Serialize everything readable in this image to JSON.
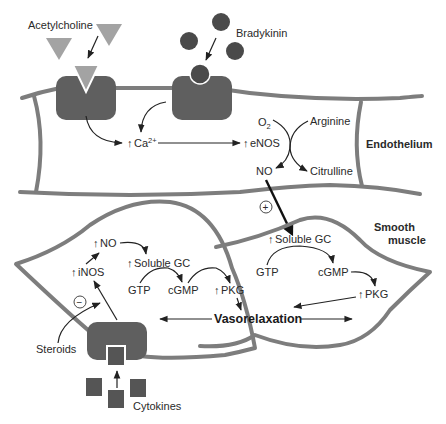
{
  "diagram": {
    "colors": {
      "membrane": "#7d7d7d",
      "receptor": "#5f5f5f",
      "acetylcholine": "#a3a3a3",
      "bradykinin": "#4a4a4a",
      "cytokine": "#555555",
      "text": "#2a2a2a"
    },
    "ligands": {
      "acetylcholine": "Acetylcholine",
      "bradykinin": "Bradykinin",
      "cytokines": "Cytokines",
      "steroids": "Steroids"
    },
    "endothelium": {
      "label": "Endothelium",
      "ca": "Ca",
      "ca_sup": "2+",
      "enos": "eNOS",
      "o2": "O",
      "o2_sub": "2",
      "arginine": "Arginine",
      "no": "NO",
      "citrulline": "Citrulline"
    },
    "plus_sign": "+",
    "minus_sign": "−",
    "up_arrow": "↑",
    "smooth_muscle": {
      "label_line1": "Smooth",
      "label_line2": "muscle",
      "right_cell": {
        "soluble_gc": "Soluble GC",
        "gtp": "GTP",
        "cgmp": "cGMP",
        "pkg": "PKG"
      },
      "left_cell": {
        "no": "NO",
        "inos": "iNOS",
        "soluble_gc": "Soluble GC",
        "gtp": "GTP",
        "cgmp": "cGMP",
        "pkg": "PKG"
      },
      "outcome": "Vasorelaxation"
    }
  }
}
